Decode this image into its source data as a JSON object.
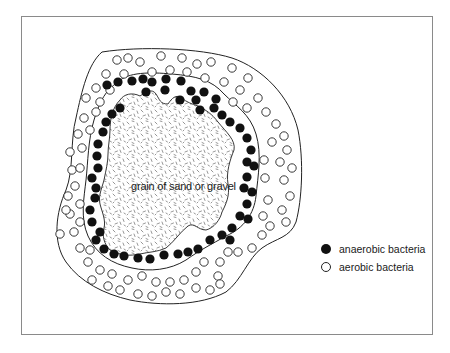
{
  "figure": {
    "labels": {
      "grain": "grain of sand or gravel"
    },
    "legend": [
      {
        "symbol": "filled-circle",
        "label": "anaerobic bacteria"
      },
      {
        "symbol": "open-circle",
        "label": "aerobic bacteria"
      }
    ],
    "colors": {
      "stroke": "#222222",
      "frame": "#8a8a8a",
      "stipple": "#6a6a6a",
      "fill_dot": "#111111"
    },
    "paths": {
      "outer": "M102,52 C140,46 200,48 232,58 C262,68 290,96 298,130 C304,160 302,200 296,222 C290,238 276,238 262,248 C248,258 242,280 226,292 C200,306 160,306 130,300 C104,294 80,282 66,262 C52,242 56,212 66,190 C74,170 70,140 76,118 C82,90 88,64 102,52 Z",
      "middle": "M118,82 C128,72 150,72 172,74 C196,76 212,80 224,94 C236,106 250,114 256,134 C262,154 258,176 256,196 C254,214 244,228 226,236 C212,244 200,250 186,260 C170,270 150,272 132,268 C112,264 96,254 88,236 C80,218 84,198 86,180 C88,162 88,140 94,120 C100,100 106,90 118,82 Z",
      "inner": "M120,100 C124,94 132,92 140,96 C146,92 152,88 156,94 C160,100 160,104 168,104 C172,98 176,94 182,98 C186,102 192,104 198,106 C206,110 212,114 218,122 C226,132 236,140 234,150 C230,160 226,172 228,184 C230,196 226,204 222,212 C220,220 214,228 206,230 C198,230 194,222 188,226 C180,232 174,242 166,248 C158,252 148,252 140,254 C130,256 120,256 110,250 C104,244 102,236 104,228 C106,220 102,212 100,204 C98,196 102,188 104,180 C106,170 108,162 108,154 C108,146 110,138 110,130 C110,120 112,108 120,100 Z"
    },
    "anaerobic_dots": [
      [
        107,
        85
      ],
      [
        118,
        82
      ],
      [
        132,
        81
      ],
      [
        143,
        79
      ],
      [
        152,
        82
      ],
      [
        166,
        79
      ],
      [
        181,
        81
      ],
      [
        191,
        91
      ],
      [
        204,
        92
      ],
      [
        216,
        99
      ],
      [
        200,
        110
      ],
      [
        214,
        108
      ],
      [
        222,
        115
      ],
      [
        230,
        122
      ],
      [
        240,
        128
      ],
      [
        247,
        138
      ],
      [
        251,
        150
      ],
      [
        247,
        162
      ],
      [
        254,
        166
      ],
      [
        247,
        177
      ],
      [
        244,
        188
      ],
      [
        252,
        192
      ],
      [
        247,
        204
      ],
      [
        240,
        216
      ],
      [
        248,
        219
      ],
      [
        232,
        228
      ],
      [
        222,
        235
      ],
      [
        210,
        240
      ],
      [
        230,
        240
      ],
      [
        198,
        249
      ],
      [
        188,
        252
      ],
      [
        178,
        254
      ],
      [
        164,
        255
      ],
      [
        150,
        259
      ],
      [
        138,
        258
      ],
      [
        124,
        256
      ],
      [
        114,
        254
      ],
      [
        104,
        249
      ],
      [
        96,
        240
      ],
      [
        100,
        232
      ],
      [
        92,
        222
      ],
      [
        90,
        210
      ],
      [
        95,
        198
      ],
      [
        96,
        188
      ],
      [
        92,
        178
      ],
      [
        98,
        168
      ],
      [
        97,
        156
      ],
      [
        98,
        144
      ],
      [
        103,
        132
      ],
      [
        106,
        122
      ],
      [
        112,
        114
      ],
      [
        120,
        108
      ],
      [
        146,
        92
      ],
      [
        180,
        100
      ],
      [
        196,
        100
      ],
      [
        165,
        90
      ]
    ],
    "aerobic_dots": [
      [
        117,
        60
      ],
      [
        128,
        58
      ],
      [
        140,
        62
      ],
      [
        161,
        56
      ],
      [
        182,
        58
      ],
      [
        197,
        64
      ],
      [
        211,
        62
      ],
      [
        232,
        68
      ],
      [
        248,
        78
      ],
      [
        106,
        74
      ],
      [
        124,
        74
      ],
      [
        152,
        72
      ],
      [
        170,
        70
      ],
      [
        187,
        72
      ],
      [
        205,
        78
      ],
      [
        224,
        82
      ],
      [
        240,
        90
      ],
      [
        258,
        98
      ],
      [
        96,
        88
      ],
      [
        110,
        90
      ],
      [
        233,
        102
      ],
      [
        247,
        108
      ],
      [
        266,
        112
      ],
      [
        276,
        124
      ],
      [
        284,
        136
      ],
      [
        272,
        142
      ],
      [
        287,
        150
      ],
      [
        264,
        160
      ],
      [
        280,
        162
      ],
      [
        292,
        168
      ],
      [
        265,
        178
      ],
      [
        284,
        180
      ],
      [
        290,
        196
      ],
      [
        268,
        200
      ],
      [
        282,
        210
      ],
      [
        286,
        222
      ],
      [
        263,
        216
      ],
      [
        270,
        226
      ],
      [
        262,
        235
      ],
      [
        252,
        248
      ],
      [
        238,
        252
      ],
      [
        228,
        252
      ],
      [
        220,
        262
      ],
      [
        218,
        276
      ],
      [
        204,
        262
      ],
      [
        196,
        272
      ],
      [
        184,
        280
      ],
      [
        170,
        282
      ],
      [
        156,
        282
      ],
      [
        142,
        276
      ],
      [
        128,
        280
      ],
      [
        112,
        274
      ],
      [
        100,
        270
      ],
      [
        88,
        262
      ],
      [
        80,
        248
      ],
      [
        90,
        250
      ],
      [
        74,
        232
      ],
      [
        80,
        222
      ],
      [
        70,
        214
      ],
      [
        80,
        204
      ],
      [
        68,
        196
      ],
      [
        75,
        186
      ],
      [
        72,
        170
      ],
      [
        80,
        168
      ],
      [
        70,
        152
      ],
      [
        82,
        148
      ],
      [
        78,
        134
      ],
      [
        90,
        130
      ],
      [
        84,
        118
      ],
      [
        96,
        112
      ],
      [
        100,
        102
      ],
      [
        86,
        98
      ],
      [
        196,
        288
      ],
      [
        180,
        294
      ],
      [
        166,
        292
      ],
      [
        152,
        296
      ],
      [
        138,
        294
      ],
      [
        220,
        284
      ],
      [
        210,
        290
      ],
      [
        108,
        286
      ],
      [
        120,
        290
      ],
      [
        92,
        280
      ],
      [
        60,
        234
      ],
      [
        66,
        210
      ]
    ]
  }
}
